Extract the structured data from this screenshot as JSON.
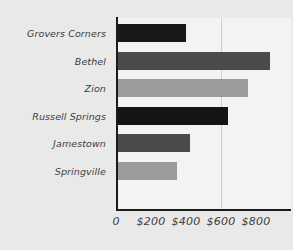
{
  "chart_data": {
    "type": "bar",
    "orientation": "horizontal",
    "title": "",
    "subtitle": "",
    "xlabel": "",
    "ylabel": "",
    "categories": [
      "Grovers Corners",
      "Bethel",
      "Zion",
      "Russell Springs",
      "Jamestown",
      "Springville"
    ],
    "values": [
      400,
      880,
      755,
      640,
      420,
      350
    ],
    "tick_labels": [
      "0",
      "$200",
      "$400",
      "$600",
      "$800"
    ],
    "tick_values": [
      0,
      200,
      400,
      600,
      800
    ],
    "xlim": [
      0,
      1000
    ],
    "grid": true,
    "gridlines_at": [
      600
    ],
    "legend": "none",
    "bar_colors": [
      "#191919",
      "#4b4b4b",
      "#9b9b9b",
      "#141414",
      "#4b4b4b",
      "#9b9b9b"
    ]
  },
  "style": {
    "background_color": "#e9e9e9",
    "plot_background_color": "#f3f3f3",
    "axis_color": "#1b1b1b",
    "gridline_color": "#cfcfcf",
    "label_color": "#3d3d3d"
  }
}
